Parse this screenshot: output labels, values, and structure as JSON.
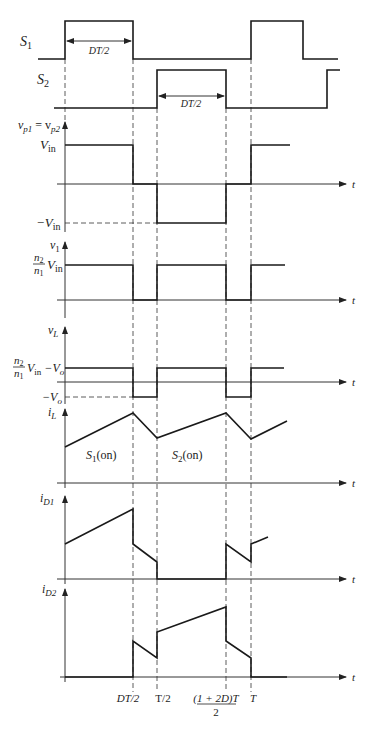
{
  "diagram": {
    "time_marks_x": [
      65,
      133,
      157,
      226,
      251
    ],
    "time_labels": [
      "DT/2",
      "T/2",
      "(1 + 2D)T",
      "2",
      "T"
    ],
    "axis_end_label": "t",
    "signals": {
      "s1": {
        "label": "S",
        "sub": "1",
        "annotation": "DT/2",
        "points": "38,59 65,59 65,21 133,21 133,59 251,59 251,21 303,21 303,59 338,59"
      },
      "s2": {
        "label": "S",
        "sub": "2",
        "annotation": "DT/2",
        "points": "54,108 157,108 157,70 226,70 226,108 327,108 327,70 340,70"
      },
      "vp": {
        "label": "v",
        "sub": "p1",
        "eq": " = v",
        "sub2": "p2",
        "level_high": "V",
        "level_high_sub": "in",
        "level_low": "−V",
        "level_low_sub": "in",
        "points": "65,145 133,145 133,184 157,184 157,223 226,223 226,184 251,184 251,145 290,145"
      },
      "v1": {
        "label": "v",
        "sub": "1",
        "level_num": "n",
        "level_num_sub": "2",
        "level_den": "n",
        "level_den_sub": "1",
        "level_tail": "V",
        "level_tail_sub": "in",
        "points": "65,265 133,265 133,300 157,300 157,265 226,265 226,300 251,300 251,265 285,265"
      },
      "vL": {
        "label": "v",
        "sub": "L",
        "level_num": "n",
        "level_num_sub": "2",
        "level_den": "n",
        "level_den_sub": "1",
        "level_tail": "V",
        "level_tail_sub": "in",
        "level_tail2": " −V",
        "level_tail2_sub": "o",
        "level_low": "−V",
        "level_low_sub": "o",
        "points": "65,368 133,368 133,397 157,397 157,368 226,368 226,397 251,397 251,368 284,368"
      },
      "iL": {
        "label": "i",
        "sub": "L",
        "region1": "S",
        "region1_sub": "1",
        "region1_tail": "(on)",
        "region2": "S",
        "region2_sub": "2",
        "region2_tail": "(on)",
        "points": "65,447 133,413 157,438 226,413 251,439 287,421"
      },
      "iD1": {
        "label": "i",
        "sub": "D1",
        "points": "65,544 133,509 133,544 157,562 157,579 226,579 226,544 251,562 251,544 268,537"
      },
      "iD2": {
        "label": "i",
        "sub": "D2",
        "points": "65,677 133,677 133,641 157,658 157,632 226,607 226,641 251,658 251,677 287,677"
      }
    }
  }
}
